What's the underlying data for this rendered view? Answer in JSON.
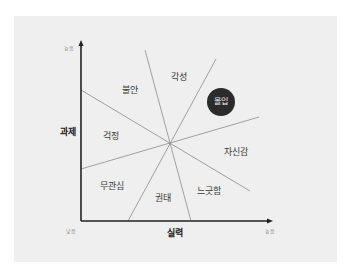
{
  "diagram": {
    "y_axis": {
      "label": "과제",
      "high_label": "높음"
    },
    "x_axis": {
      "label": "실력",
      "low_label": "낮음",
      "high_label": "높음"
    },
    "regions": [
      {
        "id": "arousal",
        "label": "각성"
      },
      {
        "id": "anxiety",
        "label": "불안"
      },
      {
        "id": "flow",
        "label": "몰입",
        "highlighted": true
      },
      {
        "id": "worry",
        "label": "걱정"
      },
      {
        "id": "control",
        "label": "자신감"
      },
      {
        "id": "apathy",
        "label": "무관심"
      },
      {
        "id": "boredom",
        "label": "권태"
      },
      {
        "id": "relaxation",
        "label": "느긋함"
      }
    ],
    "colors": {
      "background": "#efefef",
      "axis": "#222222",
      "divider": "#8c8c8c",
      "flow_fill": "#2b2b2b",
      "flow_text": "#f2f2f2"
    }
  }
}
